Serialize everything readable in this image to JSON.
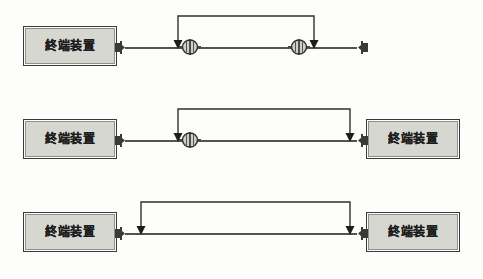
{
  "diagram": {
    "background_color": "#fdfdfc",
    "box_fill_color": "#d7d7d2",
    "line_color": "#54544e",
    "border_color": "#3a3a38",
    "terminal_label": "終端装置",
    "rows": [
      {
        "id": "row-1",
        "connector_count": 2,
        "left_terminal_label": "終端装置",
        "right_terminal_label": "終端装置",
        "bracket_span_label": "connector-to-connector",
        "arrow_left_label": "measurement-point-left",
        "arrow_right_label": "measurement-point-right"
      },
      {
        "id": "row-2",
        "connector_count": 1,
        "left_terminal_label": "終端装置",
        "right_terminal_label": "終端装置",
        "bracket_span_label": "connector-to-terminal",
        "arrow_left_label": "measurement-point-left",
        "arrow_right_label": "measurement-point-right"
      },
      {
        "id": "row-3",
        "connector_count": 0,
        "left_terminal_label": "終端装置",
        "right_terminal_label": "終端装置",
        "bracket_span_label": "terminal-to-terminal",
        "arrow_left_label": "measurement-point-left",
        "arrow_right_label": "measurement-point-right"
      }
    ],
    "icons": {
      "terminal_plug": "plug-nub-icon",
      "inline_connector": "inline-cable-connector-icon",
      "arrow": "down-arrow-icon"
    }
  }
}
